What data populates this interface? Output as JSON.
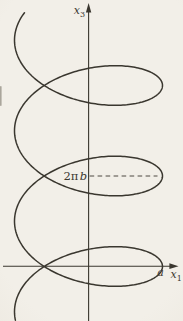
{
  "figure": {
    "labels": {
      "vertical_axis_letter": "x",
      "vertical_axis_subscript": "3",
      "horizontal_axis_letter": "x",
      "horizontal_axis_subscript": "1",
      "radius": "a",
      "pitch_coefficient": "2π",
      "pitch_variable": "b"
    },
    "colors": {
      "ink": "#3a372f",
      "paper": "#f2efe8"
    },
    "curve": {
      "type": "helix-oblique-projection",
      "center_x": 88.5,
      "amplitude": 74,
      "nose_y": 176,
      "pitch_px": 90.5,
      "wobble": 39.8,
      "t_min": -9.95,
      "t_max": 9.6,
      "step": 0.03
    }
  }
}
